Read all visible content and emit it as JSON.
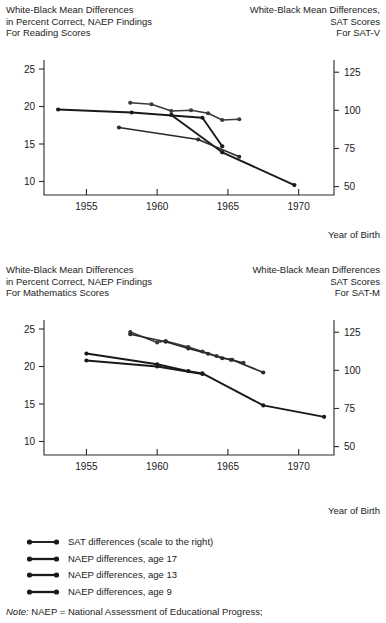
{
  "chart_data": [
    {
      "type": "line",
      "id": "reading",
      "title_left": "White-Black Mean Differences\nin Percent Correct, NAEP Findings\nFor Reading Scores",
      "title_left_lines": [
        "White-Black Mean Differences",
        "in Percent Correct, NAEP Findings",
        "For Reading Scores"
      ],
      "title_right_lines": [
        "White-Black Mean Differences,",
        "SAT Scores",
        "For SAT-V"
      ],
      "xlabel": "Year of Birth",
      "ylabel": "",
      "xlim": [
        1952.0,
        1972.5
      ],
      "ylim": [
        8.2,
        26.2
      ],
      "y2lim": [
        44.5,
        133.0
      ],
      "xticks": [
        1955,
        1960,
        1965,
        1970
      ],
      "xticklabels": [
        "1955",
        "1960",
        "1965",
        "1970"
      ],
      "yticks": [
        10,
        15,
        20,
        25
      ],
      "yticklabels": [
        "10",
        "15",
        "20",
        "25"
      ],
      "y2ticks": [
        50,
        75,
        100,
        125
      ],
      "y2ticklabels": [
        "50",
        "75",
        "100",
        "125"
      ],
      "grid": false,
      "legend": "below",
      "series": [
        {
          "name": "SAT differences (scale to the right)",
          "axis": "right",
          "color": "#1a1a1a",
          "width": 1.9,
          "points": [
            [
              1961.0,
              97.0
            ],
            [
              1964.6,
              72.5
            ],
            [
              1969.7,
              51.0
            ]
          ]
        },
        {
          "name": "NAEP differences, age 17",
          "axis": "left",
          "color": "#3a3a3a",
          "width": 1.5,
          "points": [
            [
              1958.1,
              20.5
            ],
            [
              1959.6,
              20.3
            ],
            [
              1961.0,
              19.4
            ],
            [
              1962.4,
              19.5
            ],
            [
              1963.6,
              19.1
            ],
            [
              1964.6,
              18.2
            ],
            [
              1965.8,
              18.3
            ]
          ]
        },
        {
          "name": "NAEP differences, age 13",
          "axis": "left",
          "color": "#1a1a1a",
          "width": 1.9,
          "points": [
            [
              1953.0,
              19.6
            ],
            [
              1958.2,
              19.2
            ],
            [
              1963.2,
              18.5
            ],
            [
              1964.6,
              14.7
            ]
          ]
        },
        {
          "name": "NAEP differences, age 9",
          "axis": "left",
          "color": "#2a2a2a",
          "width": 1.7,
          "points": [
            [
              1957.3,
              17.2
            ],
            [
              1962.9,
              15.6
            ],
            [
              1965.8,
              13.3
            ]
          ]
        }
      ]
    },
    {
      "type": "line",
      "id": "mathematics",
      "title_left_lines": [
        "White-Black Mean Differences",
        "in Percent Correct, NAEP Findings",
        "For Mathematics Scores"
      ],
      "title_right_lines": [
        "White-Black Mean Differences",
        "SAT Scores",
        "For SAT-M"
      ],
      "xlabel": "Year of Birth",
      "ylabel": "",
      "xlim": [
        1952.0,
        1972.5
      ],
      "ylim": [
        8.2,
        26.2
      ],
      "y2lim": [
        44.5,
        133.0
      ],
      "xticks": [
        1955,
        1960,
        1965,
        1970
      ],
      "xticklabels": [
        "1955",
        "1960",
        "1965",
        "1970"
      ],
      "yticks": [
        10,
        15,
        20,
        25
      ],
      "yticklabels": [
        "10",
        "15",
        "20",
        "25"
      ],
      "y2ticks": [
        50,
        75,
        100,
        125
      ],
      "y2ticklabels": [
        "50",
        "75",
        "100",
        "125"
      ],
      "grid": false,
      "legend": "below",
      "series": [
        {
          "name": "SAT differences (scale to the right)",
          "axis": "right",
          "color": "#1a1a1a",
          "width": 1.9,
          "points": [
            [
              1955.0,
              111.0
            ],
            [
              1960.0,
              104.0
            ],
            [
              1962.2,
              99.5
            ],
            [
              1963.2,
              98.0
            ],
            [
              1967.5,
              77.0
            ],
            [
              1971.8,
              69.5
            ]
          ]
        },
        {
          "name": "NAEP differences, age 17",
          "axis": "left",
          "color": "#3a3a3a",
          "width": 1.5,
          "points": [
            [
              1958.1,
              24.6
            ],
            [
              1960.0,
              23.2
            ],
            [
              1960.6,
              23.4
            ],
            [
              1962.2,
              22.6
            ],
            [
              1963.2,
              22.0
            ],
            [
              1964.2,
              21.4
            ],
            [
              1965.2,
              20.9
            ],
            [
              1966.1,
              20.5
            ]
          ]
        },
        {
          "name": "NAEP differences, age 13",
          "axis": "left",
          "color": "#1a1a1a",
          "width": 1.9,
          "points": [
            [
              1955.0,
              20.8
            ],
            [
              1960.0,
              20.0
            ],
            [
              1963.2,
              19.0
            ]
          ]
        },
        {
          "name": "NAEP differences, age 9",
          "axis": "left",
          "color": "#2a2a2a",
          "width": 1.7,
          "points": [
            [
              1958.1,
              24.3
            ],
            [
              1960.6,
              23.3
            ],
            [
              1962.2,
              22.4
            ],
            [
              1963.6,
              21.7
            ],
            [
              1964.6,
              21.1
            ],
            [
              1965.3,
              20.9
            ],
            [
              1967.5,
              19.2
            ]
          ]
        }
      ]
    }
  ],
  "legend": {
    "items": [
      {
        "label": "SAT differences (scale to the right)",
        "color": "#1a1a1a",
        "width": 1.9
      },
      {
        "label": "NAEP differences, age 17",
        "color": "#1a1a1a",
        "width": 2.3
      },
      {
        "label": "NAEP differences, age 13",
        "color": "#1a1a1a",
        "width": 2.3
      },
      {
        "label": "NAEP differences, age 9",
        "color": "#1a1a1a",
        "width": 2.3
      }
    ]
  },
  "note": {
    "prefix": "Note:",
    "text": " NAEP = National Assessment of Educational Progress;"
  }
}
